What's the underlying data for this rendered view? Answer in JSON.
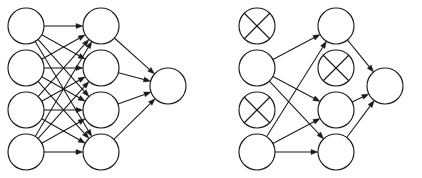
{
  "figure": {
    "title": "",
    "background_color": "#ffffff",
    "stroke_color": "#1a1a1a",
    "width": 422,
    "height": 178
  },
  "panels": [
    {
      "id": "standard-network",
      "caption": "",
      "origin_x": 0,
      "layers": [
        {
          "name": "input-layer",
          "x": 26,
          "nodes": [
            {
              "id": "L-in-1",
              "y": 26,
              "state": "active"
            },
            {
              "id": "L-in-2",
              "y": 68,
              "state": "active"
            },
            {
              "id": "L-in-3",
              "y": 110,
              "state": "active"
            },
            {
              "id": "L-in-4",
              "y": 152,
              "state": "active"
            }
          ]
        },
        {
          "name": "hidden-layer",
          "x": 101,
          "nodes": [
            {
              "id": "L-hid-1",
              "y": 26,
              "state": "active"
            },
            {
              "id": "L-hid-2",
              "y": 68,
              "state": "active"
            },
            {
              "id": "L-hid-3",
              "y": 110,
              "state": "active"
            },
            {
              "id": "L-hid-4",
              "y": 152,
              "state": "active"
            }
          ]
        },
        {
          "name": "output-layer",
          "x": 168,
          "nodes": [
            {
              "id": "L-out-1",
              "y": 86,
              "state": "active"
            }
          ]
        }
      ],
      "edges": [
        {
          "from": "L-in-1",
          "to": "L-hid-1"
        },
        {
          "from": "L-in-1",
          "to": "L-hid-2"
        },
        {
          "from": "L-in-1",
          "to": "L-hid-3"
        },
        {
          "from": "L-in-1",
          "to": "L-hid-4"
        },
        {
          "from": "L-in-2",
          "to": "L-hid-1"
        },
        {
          "from": "L-in-2",
          "to": "L-hid-2"
        },
        {
          "from": "L-in-2",
          "to": "L-hid-3"
        },
        {
          "from": "L-in-2",
          "to": "L-hid-4"
        },
        {
          "from": "L-in-3",
          "to": "L-hid-1"
        },
        {
          "from": "L-in-3",
          "to": "L-hid-2"
        },
        {
          "from": "L-in-3",
          "to": "L-hid-3"
        },
        {
          "from": "L-in-3",
          "to": "L-hid-4"
        },
        {
          "from": "L-in-4",
          "to": "L-hid-1"
        },
        {
          "from": "L-in-4",
          "to": "L-hid-2"
        },
        {
          "from": "L-in-4",
          "to": "L-hid-3"
        },
        {
          "from": "L-in-4",
          "to": "L-hid-4"
        },
        {
          "from": "L-hid-1",
          "to": "L-out-1"
        },
        {
          "from": "L-hid-2",
          "to": "L-out-1"
        },
        {
          "from": "L-hid-3",
          "to": "L-out-1"
        },
        {
          "from": "L-hid-4",
          "to": "L-out-1"
        }
      ]
    },
    {
      "id": "dropout-network",
      "caption": "",
      "origin_x": 211,
      "layers": [
        {
          "name": "input-layer",
          "x": 257,
          "nodes": [
            {
              "id": "R-in-1",
              "y": 26,
              "state": "dropped"
            },
            {
              "id": "R-in-2",
              "y": 68,
              "state": "active"
            },
            {
              "id": "R-in-3",
              "y": 110,
              "state": "dropped"
            },
            {
              "id": "R-in-4",
              "y": 152,
              "state": "active"
            }
          ]
        },
        {
          "name": "hidden-layer",
          "x": 336,
          "nodes": [
            {
              "id": "R-hid-1",
              "y": 26,
              "state": "active"
            },
            {
              "id": "R-hid-2",
              "y": 68,
              "state": "dropped"
            },
            {
              "id": "R-hid-3",
              "y": 110,
              "state": "active"
            },
            {
              "id": "R-hid-4",
              "y": 152,
              "state": "active"
            }
          ]
        },
        {
          "name": "output-layer",
          "x": 385,
          "nodes": [
            {
              "id": "R-out-1",
              "y": 86,
              "state": "active"
            }
          ]
        }
      ],
      "edges": [
        {
          "from": "R-in-2",
          "to": "R-hid-1"
        },
        {
          "from": "R-in-2",
          "to": "R-hid-3"
        },
        {
          "from": "R-in-2",
          "to": "R-hid-4"
        },
        {
          "from": "R-in-4",
          "to": "R-hid-1"
        },
        {
          "from": "R-in-4",
          "to": "R-hid-3"
        },
        {
          "from": "R-in-4",
          "to": "R-hid-4"
        },
        {
          "from": "R-hid-1",
          "to": "R-out-1"
        },
        {
          "from": "R-hid-3",
          "to": "R-out-1"
        },
        {
          "from": "R-hid-4",
          "to": "R-out-1"
        }
      ]
    }
  ],
  "style": {
    "node_radius": 18,
    "arrowhead_length": 7,
    "arrowhead_width": 5,
    "cross_inset_ratio": 0.707
  }
}
